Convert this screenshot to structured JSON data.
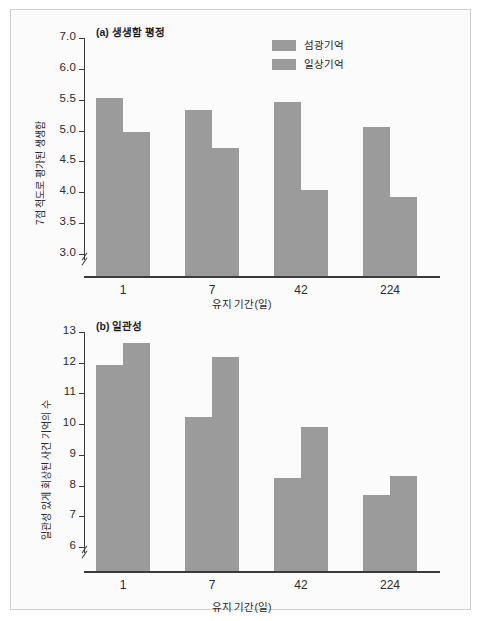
{
  "figure": {
    "background": "#fbfbfb",
    "bar_color": "#9b9b9b",
    "axis_color": "#3a3a3a"
  },
  "legend": {
    "position": "top-right-panel-a",
    "entries": [
      {
        "label": "섬광기억",
        "color": "#9b9b9b"
      },
      {
        "label": "일상기억",
        "color": "#9b9b9b"
      }
    ]
  },
  "chart_data": [
    {
      "id": "panel-a",
      "type": "bar",
      "title": "(a) 생생함 평정",
      "xlabel": "유지 기간(일)",
      "ylabel": "7점 척도로 평가된 생생함",
      "categories": [
        "1",
        "7",
        "42",
        "224"
      ],
      "ytick_labels": [
        "7.0",
        "6.0",
        "5.5",
        "5.0",
        "4.5",
        "4.0",
        "3.5",
        "3.0"
      ],
      "ytick_values": [
        7.0,
        6.0,
        5.5,
        5.0,
        4.5,
        4.0,
        3.5,
        3.0
      ],
      "ylim": [
        3.0,
        7.0
      ],
      "axis_break": true,
      "grid": false,
      "series": [
        {
          "name": "섬광기억",
          "values": [
            5.52,
            5.34,
            5.47,
            5.05
          ]
        },
        {
          "name": "일상기억",
          "values": [
            4.98,
            4.71,
            4.03,
            3.93
          ]
        }
      ]
    },
    {
      "id": "panel-b",
      "type": "bar",
      "title": "(b) 일관성",
      "xlabel": "유지 기간(일)",
      "ylabel": "일관성 있게 회상된 사건 기억의 수",
      "categories": [
        "1",
        "7",
        "42",
        "224"
      ],
      "ytick_labels": [
        "13",
        "12",
        "11",
        "10",
        "9",
        "8",
        "7",
        "6"
      ],
      "ytick_values": [
        13,
        12,
        11,
        10,
        9,
        8,
        7,
        6
      ],
      "ylim": [
        6,
        13
      ],
      "axis_break": true,
      "grid": false,
      "series": [
        {
          "name": "섬광기억",
          "values": [
            11.91,
            10.22,
            8.25,
            7.69
          ]
        },
        {
          "name": "일상기억",
          "values": [
            12.65,
            12.2,
            9.92,
            8.31
          ]
        }
      ]
    }
  ]
}
